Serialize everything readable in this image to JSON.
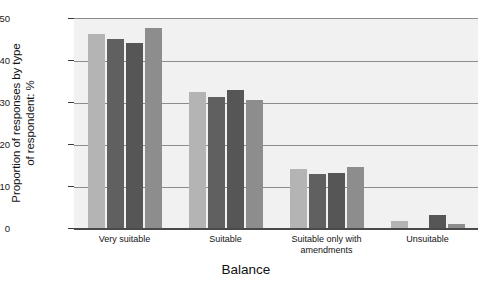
{
  "chart_data": {
    "type": "bar",
    "title": "",
    "xlabel": "Balance",
    "ylabel_line1": "Proportion of responses by type",
    "ylabel_line2": "of respondent: %",
    "categories": [
      "Very suitable",
      "Suitable",
      "Suitable only with amendments",
      "Unsuitable"
    ],
    "category_lines": [
      [
        "Very  suitable"
      ],
      [
        "Suitable"
      ],
      [
        "Suitable  only  with",
        "amendments"
      ],
      [
        "Unsuitable"
      ]
    ],
    "series": [
      {
        "name": "series-1",
        "color": "#b4b4b4",
        "values": [
          46.5,
          32.7,
          14.3,
          2.0
        ]
      },
      {
        "name": "series-2",
        "color": "#606060",
        "values": [
          45.3,
          31.5,
          13.2,
          0.3
        ]
      },
      {
        "name": "series-3",
        "color": "#565656",
        "values": [
          44.4,
          33.1,
          13.4,
          3.3
        ]
      },
      {
        "name": "series-4",
        "color": "#8d8d8d",
        "values": [
          47.8,
          30.7,
          14.7,
          1.2
        ]
      }
    ],
    "ytick_labels": [
      "0",
      "10",
      "20",
      "30",
      "40",
      "50"
    ],
    "ytick_values": [
      0,
      10,
      20,
      30,
      40,
      50
    ],
    "ylim": [
      0,
      50
    ],
    "grid": true,
    "legend": "none",
    "plot_background": "#f1f1f1",
    "gridline_color": "#8c8c8c",
    "axis_color": "#4a4a4a"
  }
}
